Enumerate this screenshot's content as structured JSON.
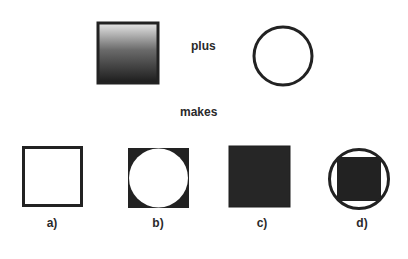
{
  "operands": {
    "source": {
      "shape": "square",
      "fill": "vertical-gradient",
      "gradient_top": "#e6e6e6",
      "gradient_bottom": "#1e1e1e",
      "border": "#222222"
    },
    "operator_label": "plus",
    "destination": {
      "shape": "circle",
      "fill": "none",
      "border": "#222222"
    }
  },
  "result_label": "makes",
  "results": [
    {
      "id": "a",
      "label": "a)",
      "description": "hollow square"
    },
    {
      "id": "b",
      "label": "b)",
      "description": "dark square with white circle cut-out"
    },
    {
      "id": "c",
      "label": "c)",
      "description": "solid dark square"
    },
    {
      "id": "d",
      "label": "d)",
      "description": "circle outline with solid dark square inside"
    }
  ],
  "colors": {
    "ink": "#222222",
    "background": "#ffffff"
  }
}
